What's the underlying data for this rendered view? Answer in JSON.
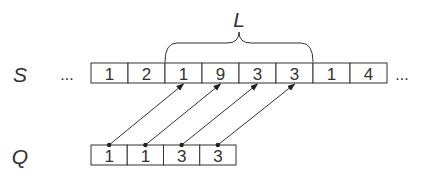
{
  "diagram": {
    "s_label": "S",
    "q_label": "Q",
    "brace_label": "L",
    "ellipsis_left": "...",
    "ellipsis_right": "...",
    "s_cells": [
      "1",
      "2",
      "1",
      "9",
      "3",
      "3",
      "1",
      "4"
    ],
    "q_cells": [
      "1",
      "1",
      "3",
      "3"
    ],
    "brace_span": {
      "start_index": 2,
      "end_index": 5
    },
    "mappings": [
      {
        "from_q": 0,
        "to_s": 2
      },
      {
        "from_q": 1,
        "to_s": 3
      },
      {
        "from_q": 2,
        "to_s": 4
      },
      {
        "from_q": 3,
        "to_s": 5
      }
    ],
    "colors": {
      "stroke": "#333333",
      "background": "#ffffff"
    }
  }
}
